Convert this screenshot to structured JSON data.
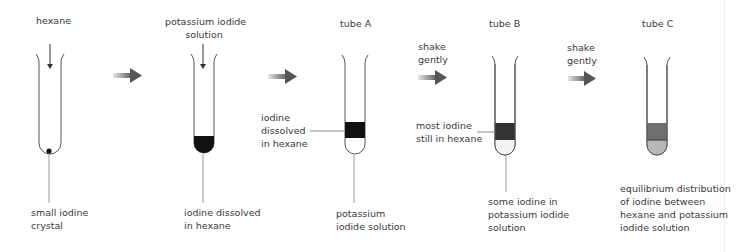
{
  "diagram": {
    "colors": {
      "iodine_dark": "#111111",
      "hexane_dark_grey": "#333333",
      "hexane_mid_grey": "#6e6e6e",
      "ki_light_grey": "#b8b8b8",
      "ki_very_light": "#f4f4f4",
      "arrow_grey": "#555555",
      "line_grey": "#888888"
    },
    "steps": [
      {
        "top_label": [
          "hexane"
        ],
        "bottom_label": [
          "small iodine",
          "crystal"
        ]
      },
      {
        "top_label": [
          "potassium iodide",
          "solution"
        ],
        "bottom_label": [
          "iodine dissolved",
          "in hexane"
        ]
      },
      {
        "top_label": [
          "tube A"
        ],
        "side_label": [
          "iodine",
          "dissolved",
          "in hexane"
        ],
        "bottom_label": [
          "potassium",
          "iodide solution"
        ]
      },
      {
        "top_label": [
          "tube B"
        ],
        "side_label": [
          "most iodine",
          "still in hexane"
        ],
        "bottom_label": [
          "some iodine in",
          "potassium iodide",
          "solution"
        ]
      },
      {
        "top_label": [
          "tube C"
        ],
        "bottom_label": [
          "equilibrium distribution",
          "of iodine between",
          "hexane and potassium",
          "iodide solution"
        ]
      }
    ],
    "arrows": [
      {
        "label": []
      },
      {
        "label": []
      },
      {
        "label": [
          "shake",
          "gently"
        ]
      },
      {
        "label": [
          "shake",
          "gently"
        ]
      }
    ]
  }
}
